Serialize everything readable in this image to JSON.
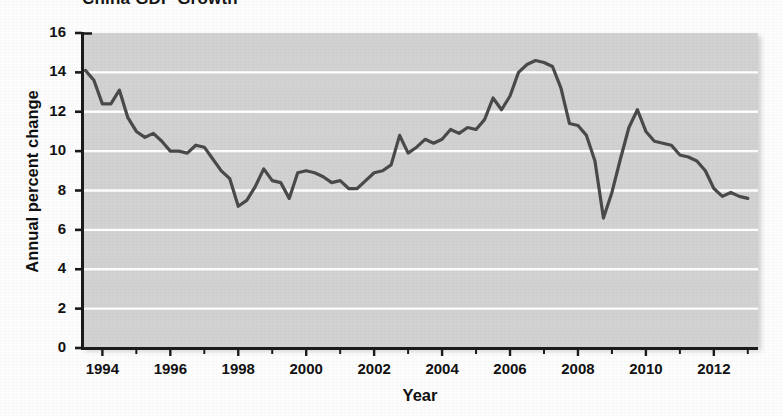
{
  "chart_data": {
    "type": "line",
    "title": "China GDP Growth",
    "xlabel": "Year",
    "ylabel": "Annual percent change",
    "xlim": [
      1993.4,
      2013.3
    ],
    "ylim": [
      0,
      16
    ],
    "ytick_labels": [
      "0",
      "2",
      "4",
      "6",
      "8",
      "10",
      "12",
      "14",
      "16"
    ],
    "ytick_values": [
      0,
      2,
      4,
      6,
      8,
      10,
      12,
      14,
      16
    ],
    "xtick_labels": [
      "1994",
      "1996",
      "1998",
      "2000",
      "2002",
      "2004",
      "2006",
      "2008",
      "2010",
      "2012"
    ],
    "xtick_values": [
      1994,
      1996,
      1998,
      2000,
      2002,
      2004,
      2006,
      2008,
      2010,
      2012
    ],
    "x_minor_tick_interval": 1,
    "grid": "horizontal-only",
    "grid_color": "#ffffff",
    "panel_color": "#d2d2d2",
    "line_color": "#4a4a4a",
    "line_width": 3.2,
    "legend": "none",
    "series": [
      {
        "name": "Annual percent change",
        "x": [
          1993.5,
          1993.75,
          1994.0,
          1994.25,
          1994.5,
          1994.75,
          1995.0,
          1995.25,
          1995.5,
          1995.75,
          1996.0,
          1996.25,
          1996.5,
          1996.75,
          1997.0,
          1997.25,
          1997.5,
          1997.75,
          1998.0,
          1998.25,
          1998.5,
          1998.75,
          1999.0,
          1999.25,
          1999.5,
          1999.75,
          2000.0,
          2000.25,
          2000.5,
          2000.75,
          2001.0,
          2001.25,
          2001.5,
          2001.75,
          2002.0,
          2002.25,
          2002.5,
          2002.75,
          2003.0,
          2003.25,
          2003.5,
          2003.75,
          2004.0,
          2004.25,
          2004.5,
          2004.75,
          2005.0,
          2005.25,
          2005.5,
          2005.75,
          2006.0,
          2006.25,
          2006.5,
          2006.75,
          2007.0,
          2007.25,
          2007.5,
          2007.75,
          2008.0,
          2008.25,
          2008.5,
          2008.75,
          2009.0,
          2009.25,
          2009.5,
          2009.75,
          2010.0,
          2010.25,
          2010.5,
          2010.75,
          2011.0,
          2011.25,
          2011.5,
          2011.75,
          2012.0,
          2012.25,
          2012.5,
          2012.75,
          2013.0
        ],
        "values": [
          14.1,
          13.6,
          12.4,
          12.4,
          13.1,
          11.7,
          11.0,
          10.7,
          10.9,
          10.5,
          10.0,
          10.0,
          9.9,
          10.3,
          10.2,
          9.6,
          9.0,
          8.6,
          7.2,
          7.5,
          8.2,
          9.1,
          8.5,
          8.4,
          7.6,
          8.9,
          9.0,
          8.9,
          8.7,
          8.4,
          8.5,
          8.1,
          8.1,
          8.5,
          8.9,
          9.0,
          9.3,
          10.8,
          9.9,
          10.2,
          10.6,
          10.4,
          10.6,
          11.1,
          10.9,
          11.2,
          11.1,
          11.6,
          12.7,
          12.1,
          12.8,
          14.0,
          14.4,
          14.6,
          14.5,
          14.3,
          13.2,
          11.4,
          11.3,
          10.8,
          9.5,
          6.6,
          7.9,
          9.6,
          11.2,
          12.1,
          11.0,
          10.5,
          10.4,
          10.3,
          9.8,
          9.7,
          9.5,
          9.0,
          8.1,
          7.7,
          7.9,
          7.7,
          7.6
        ]
      }
    ]
  }
}
